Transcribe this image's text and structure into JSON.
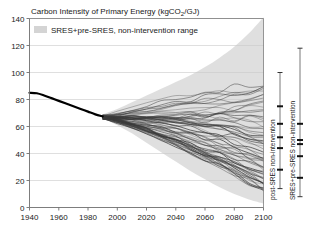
{
  "chart_data": {
    "type": "line",
    "title": "Carbon Intensity of Primary Energy (kgCO2/GJ)",
    "title_plain": "Carbon Intensity of Primary Energy (kgCO",
    "title_sub": "2",
    "title_tail": "/GJ)",
    "xlabel": "",
    "ylabel": "",
    "xlim": [
      1940,
      2100
    ],
    "ylim": [
      0,
      140
    ],
    "xticks": [
      1940,
      1960,
      1980,
      2000,
      2020,
      2040,
      2060,
      2080,
      2100
    ],
    "yticks": [
      0,
      20,
      40,
      60,
      80,
      100,
      120,
      140
    ],
    "grid": "horizontal",
    "legend": {
      "position": "top-left-inside",
      "entries": [
        {
          "label": "SRES+pre-SRES, non-intervention range",
          "swatch": "#d4d4d4"
        }
      ]
    },
    "series": [
      {
        "name": "historical carbon intensity",
        "type": "line",
        "color": "#000000",
        "width": 2.2,
        "x": [
          1940,
          1945,
          1950,
          1955,
          1960,
          1965,
          1970,
          1975,
          1980,
          1985,
          1990
        ],
        "y": [
          85.0,
          84.6,
          83.0,
          81.0,
          79.0,
          77.0,
          75.0,
          73.0,
          71.0,
          69.0,
          67.5
        ]
      },
      {
        "name": "non-intervention range band upper",
        "type": "area-bound",
        "color": "#d9d9d9",
        "x": [
          1990,
          2000,
          2010,
          2020,
          2030,
          2040,
          2050,
          2060,
          2070,
          2080,
          2090,
          2100
        ],
        "y": [
          69,
          73,
          78,
          83,
          88,
          93,
          98,
          104,
          111,
          119,
          129,
          141
        ]
      },
      {
        "name": "non-intervention range band lower",
        "type": "area-bound",
        "color": "#d9d9d9",
        "x": [
          1990,
          2000,
          2010,
          2020,
          2030,
          2040,
          2050,
          2060,
          2070,
          2080,
          2090,
          2100
        ],
        "y": [
          66,
          61,
          55,
          48,
          41,
          34,
          27,
          21,
          15,
          10,
          6,
          3
        ]
      }
    ],
    "scenario_ensemble": {
      "name": "SRES and pre-SRES scenario trajectories",
      "color": "#3a3a3a",
      "count": 62,
      "x": [
        1990,
        2000,
        2010,
        2020,
        2030,
        2040,
        2050,
        2060,
        2070,
        2080,
        2090,
        2100
      ],
      "start_value": 67,
      "end_range": [
        12,
        92
      ],
      "note": "spaghetti of non-intervention emissions scenarios fanning out from 1990"
    },
    "range_bars": [
      {
        "name": "post-SRES non-intervention",
        "label": "post-SRES non-intervention",
        "min": 14,
        "max": 100,
        "markers": [
          28,
          44,
          52,
          62,
          75
        ],
        "x_pos_px": 280
      },
      {
        "name": "SRES+pre-SRES non-intervention",
        "label": "SRES+pre-SRES non-intervention",
        "min": 8,
        "max": 118,
        "markers": [
          22,
          38,
          47,
          50,
          62
        ],
        "x_pos_px": 300
      }
    ]
  },
  "colors": {
    "band": "#d9d9d9",
    "swatch": "#d4d4d4",
    "grid": "#c9c9c9",
    "axis": "#6e6e6e",
    "historical": "#000000",
    "scenario": "#3a3a3a",
    "text": "#1a1a1a"
  }
}
